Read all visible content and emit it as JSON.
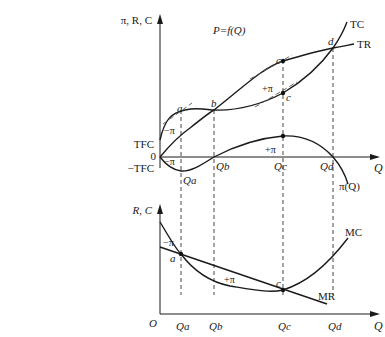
{
  "top_panel": {
    "y_axis_label": "π, R, C",
    "function_label": "P=f(Q)",
    "x_axis_label": "Q",
    "origin_label": "0",
    "tfc_label": "TFC",
    "neg_tfc_label": "−TFC",
    "curves": {
      "tc": "TC",
      "tr": "TR",
      "profit": "π(Q)"
    },
    "points": {
      "a": "a",
      "b": "b",
      "c_upper": "c",
      "c_lower": "c",
      "d": "d"
    },
    "region_labels": {
      "neg_pi_curves": "−π",
      "neg_pi_profit": "−π",
      "pos_pi_curves": "+π",
      "pos_pi_profit": "+π"
    },
    "x_ticks": [
      "Qa",
      "Qb",
      "Qc",
      "Qd"
    ]
  },
  "bottom_panel": {
    "y_axis_label": "R, C",
    "x_axis_label": "Q",
    "origin_label": "O",
    "curves": {
      "mc": "MC",
      "mr": "MR"
    },
    "points": {
      "a": "a",
      "c": "c"
    },
    "region_labels": {
      "neg_pi": "−π",
      "pos_pi": "+π"
    },
    "x_ticks": [
      "Qa",
      "Qb",
      "Qc",
      "Qd"
    ]
  }
}
